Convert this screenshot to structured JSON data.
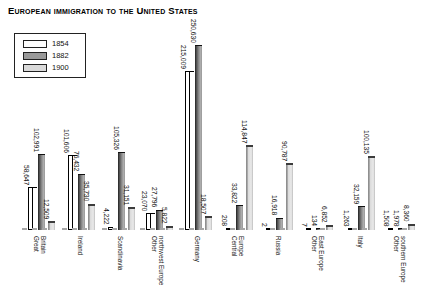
{
  "chart_data": {
    "type": "bar",
    "title": "European immigration to the United States",
    "legend_position": "top-left",
    "grid": false,
    "ylim": [
      0,
      250630
    ],
    "categories": [
      "Great Britain",
      "Ireland",
      "Scandinavia",
      "Other northwest Europe",
      "Germany",
      "Central Europe",
      "Russia",
      "Other East Europe",
      "Italy",
      "Other southern Europe"
    ],
    "series": [
      {
        "name": "1854",
        "color": "#ffffff",
        "values": [
          58647,
          101606,
          4222,
          23070,
          215009,
          208,
          2,
          7,
          1263,
          1508
        ],
        "labels": [
          "58,647",
          "101,606",
          "4,222",
          "23,070",
          "215,009",
          "208",
          "2",
          "7",
          "1,263",
          "1,508"
        ]
      },
      {
        "name": "1882",
        "color": "#9a9a9a",
        "values": [
          102991,
          76432,
          105326,
          27796,
          250630,
          33822,
          16918,
          134,
          32159,
          1978
        ],
        "labels": [
          "102,991",
          "76,432",
          "105,326",
          "27,796",
          "250,630",
          "33,822",
          "16,918",
          "134",
          "32,159",
          "1,978"
        ]
      },
      {
        "name": "1900",
        "color": "#d9d9d9",
        "values": [
          12509,
          35730,
          31151,
          5822,
          18507,
          114847,
          90787,
          6852,
          100135,
          8360
        ],
        "labels": [
          "12,509",
          "35,730",
          "31,151",
          "5,822",
          "18,507",
          "114,847",
          "90,787",
          "6,852",
          "100,135",
          "8,360"
        ]
      }
    ]
  }
}
